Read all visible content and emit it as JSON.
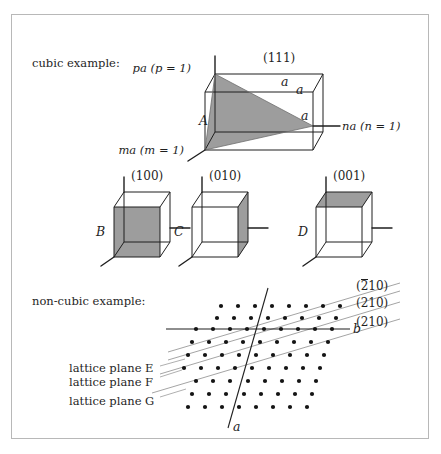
{
  "figure": {
    "background": "#ffffff",
    "frame_color": "#b8b8b8",
    "ink_color": "#1f1f1f",
    "shade_color": "#9d9d9d",
    "thin_line_color": "#9a9a9a"
  },
  "sections": {
    "cubic_label": "cubic example:",
    "noncubic_label": "non-cubic example:"
  },
  "cubic": {
    "plane_index": "(111)",
    "vertex_label": "A",
    "axis_p": "pa (p = 1)",
    "axis_m": "ma (m = 1)",
    "axis_n": "na (n = 1)",
    "edge_a_top_left": "a",
    "edge_a_top_right": "a",
    "edge_a_right": "a"
  },
  "cube_row": [
    {
      "letter": "B",
      "index": "(100)"
    },
    {
      "letter": "C",
      "index": "(010)"
    },
    {
      "letter": "D",
      "index": "(001)"
    }
  ],
  "lattice": {
    "axis_a": "a",
    "axis_b": "b",
    "plane_labels": [
      "lattice plane E",
      "lattice plane F",
      "lattice plane G"
    ],
    "index_top": "(210)",
    "index_top_has_bar": "2",
    "index_mid": "(210)",
    "index_bot": "(210)"
  }
}
